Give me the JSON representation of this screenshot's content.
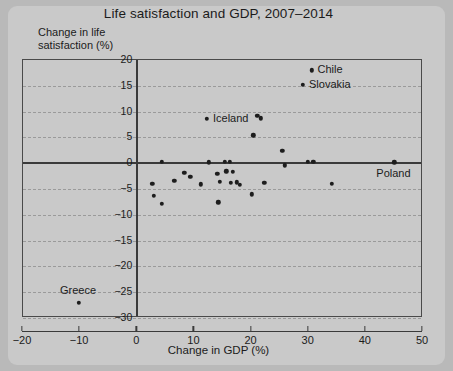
{
  "chart_data": {
    "type": "scatter",
    "title": "Life satisfaction and GDP, 2007–2014",
    "xlabel": "Change in GDP (%)",
    "ylabel": "Change in life\nsatisfaction (%)",
    "xlim": [
      -20,
      50
    ],
    "ylim": [
      -30,
      20
    ],
    "xticks": [
      -20,
      -10,
      0,
      10,
      20,
      30,
      40,
      50
    ],
    "xtick_labels": [
      "−20",
      "−10",
      "0",
      "10",
      "20",
      "30",
      "40",
      "50"
    ],
    "yticks": [
      20,
      15,
      10,
      5,
      0,
      -5,
      -10,
      -15,
      -20,
      -25,
      -30
    ],
    "ytick_labels": [
      "20",
      "15",
      "10",
      "5",
      "0",
      "−5",
      "−10",
      "−15",
      "−20",
      "−25",
      "−30"
    ],
    "grid": "horizontal-dashed",
    "legend": null,
    "points": [
      {
        "x": 30.5,
        "y": 18.0,
        "label": "Chile",
        "label_dx": 7,
        "label_dy": 0
      },
      {
        "x": 29.0,
        "y": 15.2,
        "label": "Slovakia",
        "label_dx": 7,
        "label_dy": 0
      },
      {
        "x": 12.2,
        "y": 8.6,
        "label": "Iceland",
        "label_dx": 7,
        "label_dy": 0
      },
      {
        "x": 45.0,
        "y": 0.2,
        "label": "Poland",
        "label_dx": 0,
        "label_dy": 12
      },
      {
        "x": -10.2,
        "y": -27.0,
        "label": "Greece",
        "label_dx": 0,
        "label_dy": -12
      },
      {
        "x": 21.0,
        "y": 9.2,
        "label": null
      },
      {
        "x": 21.6,
        "y": 8.7,
        "label": null
      },
      {
        "x": 20.3,
        "y": 5.4,
        "label": null
      },
      {
        "x": 25.4,
        "y": 2.4,
        "label": null
      },
      {
        "x": 4.3,
        "y": 0.3,
        "label": null
      },
      {
        "x": 12.5,
        "y": 0.2,
        "label": null
      },
      {
        "x": 15.3,
        "y": 0.3,
        "label": null
      },
      {
        "x": 16.2,
        "y": 0.3,
        "label": null
      },
      {
        "x": 25.8,
        "y": -0.4,
        "label": null
      },
      {
        "x": 29.8,
        "y": 0.3,
        "label": null
      },
      {
        "x": 30.8,
        "y": 0.3,
        "label": null
      },
      {
        "x": 8.2,
        "y": -1.9,
        "label": null
      },
      {
        "x": 9.3,
        "y": -2.6,
        "label": null
      },
      {
        "x": 14.0,
        "y": -2.0,
        "label": null
      },
      {
        "x": 15.6,
        "y": -1.6,
        "label": null
      },
      {
        "x": 16.7,
        "y": -1.7,
        "label": null
      },
      {
        "x": 2.6,
        "y": -4.0,
        "label": null
      },
      {
        "x": 6.5,
        "y": -3.4,
        "label": null
      },
      {
        "x": 11.1,
        "y": -4.1,
        "label": null
      },
      {
        "x": 14.4,
        "y": -3.6,
        "label": null
      },
      {
        "x": 16.4,
        "y": -3.8,
        "label": null
      },
      {
        "x": 17.4,
        "y": -3.7,
        "label": null
      },
      {
        "x": 17.9,
        "y": -4.2,
        "label": null
      },
      {
        "x": 22.2,
        "y": -3.8,
        "label": null
      },
      {
        "x": 34.0,
        "y": -4.0,
        "label": null
      },
      {
        "x": 2.9,
        "y": -6.3,
        "label": null
      },
      {
        "x": 4.3,
        "y": -7.9,
        "label": null
      },
      {
        "x": 14.2,
        "y": -7.6,
        "label": null
      },
      {
        "x": 20.0,
        "y": -6.0,
        "label": null
      }
    ]
  }
}
